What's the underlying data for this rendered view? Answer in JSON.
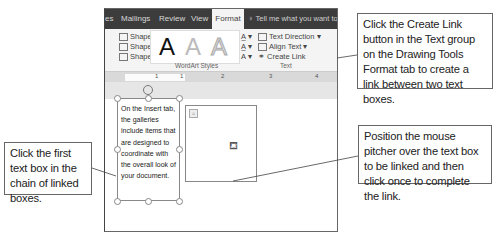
{
  "ribbon": {
    "tabs": [
      {
        "label": "es",
        "active": false
      },
      {
        "label": "Mailings",
        "active": false
      },
      {
        "label": "Review",
        "active": false
      },
      {
        "label": "View",
        "active": false
      },
      {
        "label": "Format",
        "active": true
      }
    ],
    "tell_me": "Tell me what you want to do",
    "shape_fill": "Shape Fill ▾",
    "shape_outline": "Shape Outline ▾",
    "shape_effects": "Shape Effects ▾",
    "wordart_letter": "A",
    "wordart_group_label": "WordArt Styles",
    "text_direction": "Text Direction ▾",
    "align_text": "Align Text ▾",
    "create_link": "Create Link",
    "text_group_label": "Text"
  },
  "ruler": {
    "numbers": [
      "1",
      "1",
      "2",
      "3",
      "4"
    ]
  },
  "document": {
    "text_box_1_lines": [
      "On the Insert tab,",
      "the galleries",
      "include items that",
      "are designed to",
      "coordinate with",
      "the overall look of",
      "your document."
    ]
  },
  "callouts": {
    "create_link": "Click the Create Link button in the Text group on the Drawing Tools Format tab to create a link between two text boxes.",
    "first_box": "Click the first text box in the chain of linked boxes.",
    "position_mouse": "Position the mouse pitcher over the text box to be linked and then click once to complete the link."
  },
  "colors": {
    "tabbar_bg": "#3c3c3c",
    "ribbon_bg": "#f4f4f4",
    "ruler_bg": "#d9d9d9"
  }
}
